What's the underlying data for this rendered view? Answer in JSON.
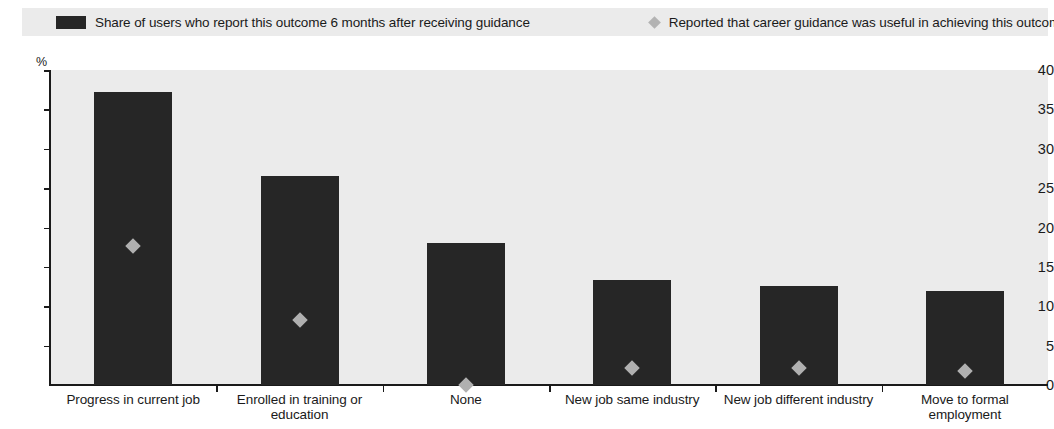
{
  "legend": {
    "items": [
      {
        "label": "Share of users who report this outcome 6 months after receiving guidance",
        "icon": "filled-square-swatch",
        "color": "#262626"
      },
      {
        "label": "Reported that career guidance was useful in achieving this outcome",
        "icon": "diamond-marker-swatch",
        "color": "#b3b3b3"
      }
    ]
  },
  "axis": {
    "unit": "%",
    "y_ticks": [
      "40",
      "35",
      "30",
      "25",
      "20",
      "15",
      "10",
      "5",
      "0"
    ]
  },
  "chart_data": {
    "type": "bar",
    "title": "",
    "xlabel": "",
    "ylabel": "%",
    "ylim": [
      0,
      40
    ],
    "ytick_step": 5,
    "grid": false,
    "legend_position": "top",
    "categories": [
      "Progress in current job",
      "Enrolled in training or education",
      "None",
      "New job same industry",
      "New job different industry",
      "Move to formal employment"
    ],
    "category_lines": [
      [
        "Progress in current job"
      ],
      [
        "Enrolled in training or",
        "education"
      ],
      [
        "None"
      ],
      [
        "New job same industry"
      ],
      [
        "New job different industry"
      ],
      [
        "Move to formal",
        "employment"
      ]
    ],
    "series": [
      {
        "name": "Share of users who report this outcome 6 months after receiving guidance",
        "type": "bar",
        "color": "#262626",
        "values": [
          37.2,
          26.5,
          18.0,
          13.3,
          12.6,
          11.9
        ]
      },
      {
        "name": "Reported that career guidance was useful in achieving this outcome",
        "type": "scatter",
        "marker": "diamond",
        "color": "#b0b0b0",
        "values": [
          17.7,
          8.2,
          0.0,
          2.2,
          2.1,
          1.8
        ]
      }
    ]
  }
}
